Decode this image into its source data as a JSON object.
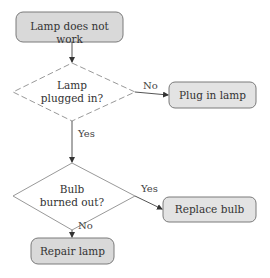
{
  "diagram": {
    "type": "flowchart",
    "nodes": [
      {
        "id": "start",
        "shape": "rounded-rect",
        "label": "Lamp does not work"
      },
      {
        "id": "q1",
        "shape": "diamond",
        "label_line1": "Lamp",
        "label_line2": "plugged in?"
      },
      {
        "id": "plug",
        "shape": "rounded-rect",
        "label": "Plug in lamp"
      },
      {
        "id": "q2",
        "shape": "diamond",
        "label_line1": "Bulb",
        "label_line2": "burned out?"
      },
      {
        "id": "replace",
        "shape": "rounded-rect",
        "label": "Replace bulb"
      },
      {
        "id": "repair",
        "shape": "rounded-rect",
        "label": "Repair lamp"
      }
    ],
    "edges": [
      {
        "from": "start",
        "to": "q1",
        "label": ""
      },
      {
        "from": "q1",
        "to": "plug",
        "label": "No"
      },
      {
        "from": "q1",
        "to": "q2",
        "label": "Yes"
      },
      {
        "from": "q2",
        "to": "replace",
        "label": "Yes"
      },
      {
        "from": "q2",
        "to": "repair",
        "label": "No"
      }
    ]
  },
  "colors": {
    "box_fill": "#d9d9d9",
    "box_stroke": "#7a7a7a",
    "line": "#555555"
  }
}
